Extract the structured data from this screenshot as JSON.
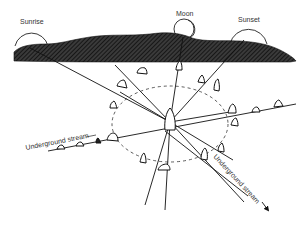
{
  "labels": {
    "sunrise": "Sunrise",
    "moon": "Moon",
    "sunset": "Sunset",
    "stream_left": "Underground stream",
    "stream_right": "Underground stream"
  },
  "colors": {
    "ink": "#1a1a1a",
    "hill_fill": "#2a2a2a",
    "background": "#ffffff"
  },
  "elements": {
    "hill": "hatched-hill-horizon",
    "center_stone": "central-standing-stone",
    "ring": "dashed-stone-ring",
    "sightlines": [
      "sunrise-alignment",
      "moon-alignment",
      "sunset-alignment"
    ],
    "streams": [
      "underground-stream-west",
      "underground-stream-southeast"
    ]
  }
}
